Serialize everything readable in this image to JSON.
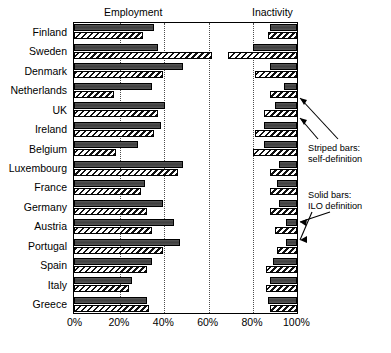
{
  "chart_data": {
    "type": "bar",
    "title": "",
    "orientation": "horizontal",
    "panels": [
      {
        "key": "employment",
        "label": "Employment",
        "anchor": "left",
        "xlim": [
          0,
          100
        ]
      },
      {
        "key": "inactivity",
        "label": "Inactivity",
        "anchor": "right",
        "xlim": [
          0,
          100
        ]
      }
    ],
    "categories": [
      "Finland",
      "Sweden",
      "Denmark",
      "Netherlands",
      "UK",
      "Ireland",
      "Belgium",
      "Luxembourg",
      "France",
      "Germany",
      "Austria",
      "Portugal",
      "Spain",
      "Italy",
      "Greece"
    ],
    "series": [
      {
        "name": "ILO definition",
        "style": "solid",
        "employment": [
          36,
          38,
          49,
          35,
          41,
          39,
          29,
          49,
          32,
          40,
          45,
          48,
          35,
          26,
          33
        ],
        "inactivity": [
          88,
          80,
          88,
          94,
          90,
          85,
          85,
          92,
          91,
          92,
          95,
          95,
          89,
          88,
          87
        ]
      },
      {
        "name": "self-definition",
        "style": "striped",
        "employment": [
          31,
          62,
          40,
          18,
          38,
          36,
          19,
          47,
          30,
          33,
          35,
          40,
          33,
          25,
          34
        ],
        "inactivity": [
          87,
          69,
          81,
          88,
          85,
          81,
          80,
          88,
          88,
          88,
          90,
          91,
          86,
          86,
          88
        ]
      }
    ],
    "xticks": [
      {
        "value": 0,
        "label": "0%"
      },
      {
        "value": 20,
        "label": "20%"
      },
      {
        "value": 40,
        "label": "40%"
      },
      {
        "value": 60,
        "label": "60%"
      },
      {
        "value": 80,
        "label": "80%"
      },
      {
        "value": 100,
        "label": "100%"
      }
    ],
    "gridlines": [
      20,
      40,
      60,
      80
    ],
    "grid": true,
    "legend_position": "right-annotations",
    "annotations": [
      {
        "id": "striped",
        "line1": "Striped bars:",
        "line2": "self-definition"
      },
      {
        "id": "solid",
        "line1": "Solid bars:",
        "line2": "ILO definition"
      }
    ],
    "colors": {
      "solid_bar": "#4a4a4a",
      "striped_bar": "#ffffff",
      "stripe": "#111111",
      "axis": "#000000",
      "grid": "#4d4d4d",
      "background": "#ffffff"
    }
  }
}
